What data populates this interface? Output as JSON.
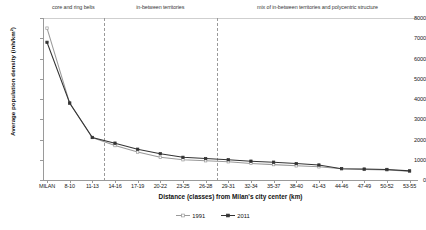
{
  "chart_data": {
    "type": "line",
    "title": "",
    "xlabel": "Distance (classes) from Milan's city center (km)",
    "ylabel": "Average population density (inh/km²)",
    "ylim": [
      0,
      8000
    ],
    "ytick_values": [
      0,
      1000,
      2000,
      3000,
      4000,
      5000,
      6000,
      7000,
      8000
    ],
    "ytick_labels": [
      "0",
      "1000",
      "2000",
      "3000",
      "4000",
      "5000",
      "6000",
      "7000",
      "8000"
    ],
    "grid": false,
    "legend_position": "bottom-center",
    "categories": [
      "MILAN",
      "8-10",
      "11-13",
      "14-16",
      "17-19",
      "20-22",
      "23-25",
      "26-28",
      "29-31",
      "32-34",
      "35-37",
      "38-40",
      "41-43",
      "44-46",
      "47-49",
      "50-52",
      "53-55"
    ],
    "series": [
      {
        "name": "1991",
        "color": "#9a9a9a",
        "marker": "open-square",
        "values": [
          7500,
          3800,
          2100,
          1700,
          1380,
          1120,
          1000,
          950,
          900,
          820,
          760,
          700,
          650,
          560,
          520,
          500,
          430
        ]
      },
      {
        "name": "2011",
        "color": "#333333",
        "marker": "filled-square",
        "values": [
          6800,
          3800,
          2100,
          1820,
          1520,
          1300,
          1120,
          1060,
          1000,
          930,
          880,
          810,
          740,
          560,
          540,
          520,
          450
        ]
      }
    ],
    "annotations": [
      {
        "text": "core and ring belts",
        "span_start": "MILAN",
        "span_end": "11-13"
      },
      {
        "text": "in-between territories",
        "span_start": "14-16",
        "span_end": "26-28"
      },
      {
        "text": "mix of in-between territories and polycentric structure",
        "span_start": "29-31",
        "span_end": "53-55"
      }
    ],
    "dividers": [
      {
        "after_category": "11-13"
      },
      {
        "after_category": "26-28"
      }
    ]
  },
  "legend": {
    "items": [
      {
        "label": "1991"
      },
      {
        "label": "2011"
      }
    ]
  }
}
